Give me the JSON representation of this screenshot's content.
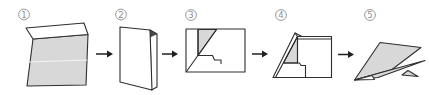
{
  "steps": [
    {
      "number": "1",
      "shape": "flat-sheet-with-top-flap"
    },
    {
      "number": "2",
      "shape": "sheet-folded-in-half"
    },
    {
      "number": "3",
      "shape": "corner-folded-to-center"
    },
    {
      "number": "4",
      "shape": "diagonal-wing-fold"
    },
    {
      "number": "5",
      "shape": "finished-paper-airplane"
    }
  ],
  "arrows": {
    "glyph": "→",
    "count": 4
  },
  "colors": {
    "background": "#ffffff",
    "paper_fill": "#d8d8d8",
    "paper_white": "#ffffff",
    "outline": "#2e2e2e",
    "crease": "#f4f4f4",
    "fold_dark": "#4a4a4a",
    "label": "#8f8f8f",
    "arrow": "#1f1f1f"
  }
}
